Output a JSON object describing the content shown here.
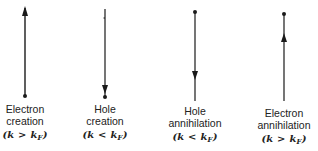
{
  "diagrams": [
    {
      "name": "electron-creation",
      "title_line1": "Electron",
      "title_line2": "creation",
      "condition_prefix": "(k > k",
      "condition_sub": "F",
      "condition_suffix": ")",
      "arrow_direction": "up",
      "dot_position": "bottom"
    },
    {
      "name": "hole-creation",
      "title_line1": "Hole",
      "title_line2": "creation",
      "condition_prefix": "(k < k",
      "condition_sub": "F",
      "condition_suffix": ")",
      "arrow_direction": "down",
      "dot_position": "bottom"
    },
    {
      "name": "hole-annihilation",
      "title_line1": "Hole",
      "title_line2": "annihilation",
      "condition_prefix": "(k < k",
      "condition_sub": "F",
      "condition_suffix": ")",
      "arrow_direction": "down",
      "dot_position": "top"
    },
    {
      "name": "electron-annihilation",
      "title_line1": "Electron",
      "title_line2": "annihilation",
      "condition_prefix": "(k > k",
      "condition_sub": "F",
      "condition_suffix": ")",
      "arrow_direction": "up",
      "dot_position": "top"
    }
  ],
  "colors": {
    "line": "#1a1a1a",
    "text": "#222222",
    "background": "#ffffff"
  }
}
